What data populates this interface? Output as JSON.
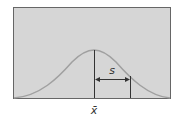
{
  "diagram": {
    "type": "normal-distribution",
    "labels": {
      "mean": "x̄",
      "std_dev": "s"
    },
    "colors": {
      "background": "#ffffff",
      "plot_fill": "#d6d6d6",
      "frame": "#666666",
      "curve": "#a0a0a0",
      "lines": "#333333"
    }
  }
}
